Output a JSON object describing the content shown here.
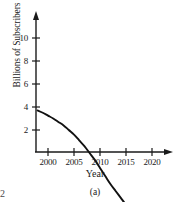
{
  "figure": {
    "caption": "(a)",
    "page_number": "2"
  },
  "chart_data": {
    "type": "line",
    "title": "",
    "xlabel": "Year",
    "ylabel": "Billions of Subscribers",
    "xlim": [
      1998,
      2023
    ],
    "ylim": [
      0,
      11.5
    ],
    "xticks": [
      2000,
      2005,
      2010,
      2015,
      2020
    ],
    "xtick_labels": [
      "2000",
      "2005",
      "2010",
      "2015",
      "2020"
    ],
    "yticks": [
      2,
      4,
      6,
      8,
      10
    ],
    "ytick_labels": [
      "2",
      "4",
      "6",
      "8",
      "10"
    ],
    "grid": false,
    "legend": null,
    "series": [
      {
        "name": "Mobile subscribers",
        "x": [
          1998,
          1999,
          2000,
          2001,
          2002,
          2003,
          2004,
          2005,
          2006,
          2007,
          2008,
          2009,
          2010,
          2011,
          2012,
          2013,
          2014,
          2015,
          2016,
          2017,
          2018,
          2019,
          2020,
          2021,
          2022
        ],
        "values": [
          0.3,
          0.5,
          0.75,
          1.0,
          1.3,
          1.6,
          2.0,
          2.4,
          2.9,
          3.4,
          4.0,
          4.6,
          5.3,
          6.0,
          6.7,
          7.3,
          7.9,
          8.5,
          9.0,
          9.5,
          9.9,
          10.2,
          10.4,
          10.6,
          10.7
        ]
      }
    ]
  },
  "axis_style": {
    "line_color": "#1a1a1a",
    "curve_color": "#111111",
    "background": "#ffffff"
  }
}
